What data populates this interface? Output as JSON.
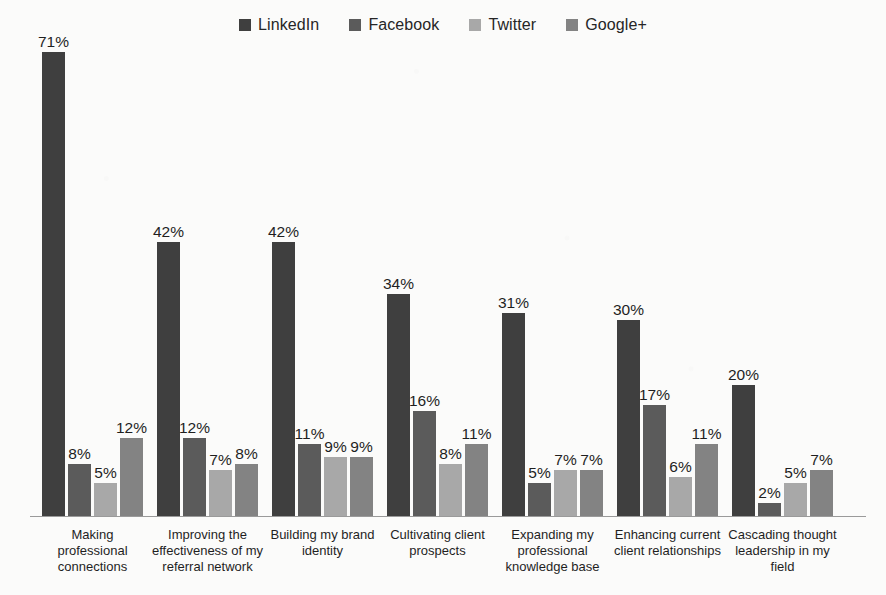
{
  "chart_data": {
    "type": "bar",
    "title": "",
    "subtitle": "",
    "xlabel": "",
    "ylabel": "",
    "ylim": [
      0,
      71
    ],
    "grid": false,
    "legend_position": "top-center",
    "value_suffix": "%",
    "categories": [
      "Making professional connections",
      "Improving the effectiveness of my referral network",
      "Building my brand identity",
      "Cultivating client prospects",
      "Expanding my professional knowledge base",
      "Enhancing current client relationships",
      "Cascading thought leadership in my field"
    ],
    "category_lines": [
      [
        "Making",
        "professional",
        "connections"
      ],
      [
        "Improving the",
        "effectiveness of my",
        "referral network"
      ],
      [
        "Building my brand",
        "identity"
      ],
      [
        "Cultivating client",
        "prospects"
      ],
      [
        "Expanding my",
        "professional",
        "knowledge base"
      ],
      [
        "Enhancing current",
        "client relationships"
      ],
      [
        "Cascading thought",
        "leadership in my",
        "field"
      ]
    ],
    "series": [
      {
        "name": "LinkedIn",
        "color": "#3f3f3f",
        "values": [
          71,
          42,
          42,
          34,
          31,
          30,
          20
        ],
        "labels": [
          "71%",
          "42%",
          "42%",
          "34%",
          "31%",
          "30%",
          "20%"
        ]
      },
      {
        "name": "Facebook",
        "color": "#5b5b5b",
        "values": [
          8,
          12,
          11,
          16,
          5,
          17,
          2
        ],
        "labels": [
          "8%",
          "12%",
          "11%",
          "16%",
          "5%",
          "17%",
          "2%"
        ]
      },
      {
        "name": "Twitter",
        "color": "#a8a8a8",
        "values": [
          5,
          7,
          9,
          8,
          7,
          6,
          5
        ],
        "labels": [
          "5%",
          "7%",
          "9%",
          "8%",
          "7%",
          "6%",
          "5%"
        ]
      },
      {
        "name": "Google+",
        "color": "#838383",
        "values": [
          12,
          8,
          9,
          11,
          7,
          11,
          7
        ],
        "labels": [
          "12%",
          "8%",
          "9%",
          "11%",
          "7%",
          "11%",
          "7%"
        ]
      }
    ]
  },
  "legend": {
    "entries": [
      {
        "label": "LinkedIn",
        "color": "#3f3f3f"
      },
      {
        "label": "Facebook",
        "color": "#5b5b5b"
      },
      {
        "label": "Twitter",
        "color": "#a8a8a8"
      },
      {
        "label": "Google+",
        "color": "#838383"
      }
    ]
  },
  "axis": {
    "baseline_color": "#9a9a9a"
  }
}
